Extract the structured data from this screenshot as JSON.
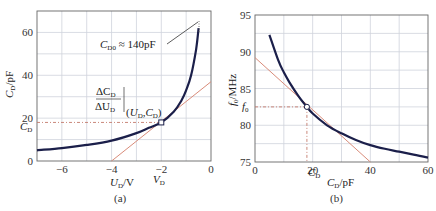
{
  "chart_data": [
    {
      "id": "a",
      "type": "line",
      "caption": "(a)",
      "xlabel": "U_D/V",
      "ylabel": "C_D/pF",
      "xlim": [
        -7,
        0
      ],
      "ylim": [
        0,
        70
      ],
      "grid": true,
      "x_ticks": [
        -6,
        -4,
        -2,
        0
      ],
      "y_ticks": [
        0,
        20,
        40,
        60
      ],
      "series": [
        {
          "name": "C_D(U_D)",
          "color": "#1b1f4a",
          "x": [
            -7,
            -6,
            -5,
            -4,
            -3,
            -2.5,
            -2,
            -1.5,
            -1.2,
            -1.0,
            -0.8,
            -0.6,
            -0.5
          ],
          "y": [
            5,
            6,
            7.5,
            9.5,
            13,
            15.5,
            18,
            23,
            28,
            33,
            40,
            52,
            62
          ]
        },
        {
          "name": "tangent",
          "color": "#d98c7a",
          "x": [
            -4,
            0
          ],
          "y": [
            0,
            37
          ]
        }
      ],
      "operating_point": {
        "x": -2,
        "y": 18
      },
      "annotations": [
        {
          "text_main": "C",
          "text_sub": "D0",
          "text_rest": " ≈ 140pF"
        },
        {
          "text": "ΔC_D / ΔU_D |(U_D, C_D)"
        },
        {
          "text": "C_D",
          "at": "y-axis"
        },
        {
          "text": "V_D",
          "at": "x-axis"
        }
      ]
    },
    {
      "id": "b",
      "type": "line",
      "caption": "(b)",
      "xlabel": "C_D/pF",
      "ylabel": "f_0/MHz",
      "xlim": [
        0,
        60
      ],
      "ylim": [
        75,
        95
      ],
      "grid": true,
      "x_ticks": [
        0,
        20,
        40,
        60
      ],
      "y_ticks": [
        75,
        80,
        85,
        90,
        95
      ],
      "series": [
        {
          "name": "f_0(C_D)",
          "color": "#1b1f4a",
          "x": [
            5,
            8,
            10,
            12,
            15,
            18,
            20,
            25,
            30,
            35,
            40,
            45,
            50,
            55,
            60
          ],
          "y": [
            92.3,
            88.9,
            87.2,
            85.8,
            84.0,
            82.5,
            81.6,
            80.0,
            78.9,
            78.0,
            77.3,
            76.8,
            76.4,
            76.0,
            75.6
          ]
        },
        {
          "name": "tangent",
          "color": "#d98c7a",
          "x": [
            0,
            40
          ],
          "y": [
            89.2,
            75
          ]
        }
      ],
      "operating_point": {
        "x": 18,
        "y": 82.5
      },
      "annotations": [
        {
          "text": "f_0",
          "at": "y-axis"
        },
        {
          "text": "C_D",
          "at": "x-axis"
        }
      ]
    }
  ],
  "labels": {
    "a": {
      "ticks_x": [
        "−6",
        "−4",
        "−2",
        "0"
      ],
      "ticks_y": [
        "0",
        "20",
        "40",
        "60"
      ],
      "xlabel_main": "U",
      "xlabel_sub": "D",
      "xlabel_rest": "/V",
      "ylabel_main": "C",
      "ylabel_sub": "D",
      "ylabel_rest": "/pF",
      "cd_main": "C",
      "cd_sub": "D",
      "vd_main": "V",
      "vd_sub": "D",
      "c0_main": "C",
      "c0_sub": "D0",
      "c0_rest": " ≈ 140pF",
      "frac_num_main": "ΔC",
      "frac_num_sub": "D",
      "frac_den_main": "ΔU",
      "frac_den_sub": "D",
      "eval_open": "(U",
      "eval_sub1": "D",
      "eval_mid": ",C",
      "eval_sub2": "D",
      "eval_close": ")",
      "caption": "(a)"
    },
    "b": {
      "ticks_x": [
        "0",
        "20",
        "40",
        "60"
      ],
      "ticks_y": [
        "75",
        "80",
        "85",
        "90",
        "95"
      ],
      "xlabel_main": "C",
      "xlabel_sub": "D",
      "xlabel_rest": "/pF",
      "ylabel_main": "f",
      "ylabel_sub": "0",
      "ylabel_rest": "/MHz",
      "f0_main": "f",
      "f0_sub": "0",
      "cd_main": "C",
      "cd_sub": "D",
      "caption": "(b)"
    }
  }
}
